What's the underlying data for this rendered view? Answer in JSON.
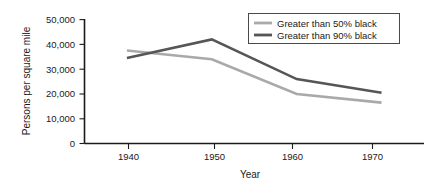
{
  "chart_data": {
    "type": "line",
    "title": "",
    "xlabel": "Year",
    "ylabel": "Persons per square mile",
    "x": [
      1940,
      1950,
      1960,
      1970
    ],
    "xtick_labels": [
      "1940",
      "1950",
      "1960",
      "1970"
    ],
    "ytick_labels": [
      "0",
      "10,000",
      "20,000",
      "30,000",
      "40,000",
      "50,000"
    ],
    "ytick_values": [
      0,
      10000,
      20000,
      30000,
      40000,
      50000
    ],
    "xlim": [
      1935,
      1975
    ],
    "ylim": [
      0,
      50000
    ],
    "grid": false,
    "legend_position": "top-right",
    "series": [
      {
        "name": "Greater than 50% black",
        "color": "#a9a9a9",
        "values": [
          37500,
          34000,
          20000,
          16500
        ]
      },
      {
        "name": "Greater than 90% black",
        "color": "#565656",
        "values": [
          34500,
          42000,
          26000,
          20500
        ]
      }
    ]
  },
  "legend": {
    "entries": [
      {
        "label": "Greater than 50% black"
      },
      {
        "label": "Greater than 90% black"
      }
    ]
  },
  "axes": {
    "y_title": "Persons per square mile",
    "x_title": "Year"
  },
  "colors": {
    "series_50": "#a9a9a9",
    "series_90": "#565656",
    "axis": "#1a1a1a",
    "background": "#ffffff"
  }
}
